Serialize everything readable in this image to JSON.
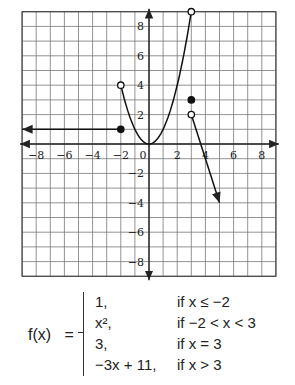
{
  "chart_data": {
    "type": "line",
    "title": "",
    "xlabel": "",
    "ylabel": "",
    "xlim": [
      -9,
      9
    ],
    "ylim": [
      -9,
      9
    ],
    "grid": true,
    "x_ticks": [
      -8,
      -6,
      -4,
      -2,
      0,
      2,
      4,
      6,
      8
    ],
    "y_ticks": [
      -8,
      -6,
      -4,
      -2,
      2,
      4,
      6,
      8
    ],
    "series": [
      {
        "name": "f(x) = 1, x <= -2",
        "kind": "ray",
        "points": [
          [
            -9,
            1
          ],
          [
            -2,
            1
          ]
        ],
        "endpoints": {
          "right": "closed",
          "left": "arrow"
        }
      },
      {
        "name": "f(x) = x^2, -2 < x < 3",
        "kind": "curve",
        "points": [
          [
            -2,
            4
          ],
          [
            -1,
            1
          ],
          [
            0,
            0
          ],
          [
            1,
            1
          ],
          [
            2,
            4
          ],
          [
            3,
            9
          ]
        ],
        "endpoints": {
          "left": "open",
          "right": "open"
        }
      },
      {
        "name": "f(3) = 3",
        "kind": "point",
        "points": [
          [
            3,
            3
          ]
        ],
        "endpoints": {
          "point": "closed"
        }
      },
      {
        "name": "f(x) = -3x + 11, x > 3",
        "kind": "ray",
        "points": [
          [
            3,
            2
          ],
          [
            5,
            -4
          ]
        ],
        "endpoints": {
          "left": "open",
          "right": "arrow"
        }
      }
    ]
  },
  "function": {
    "lhs": "f(x)",
    "equals": "=",
    "cases": [
      {
        "value": "1,",
        "condition": "if x ≤ −2"
      },
      {
        "value": "x²,",
        "condition": "if −2 < x < 3"
      },
      {
        "value": "3,",
        "condition": "if x = 3"
      },
      {
        "value": "−3x + 11,",
        "condition": "if x > 3"
      }
    ]
  }
}
